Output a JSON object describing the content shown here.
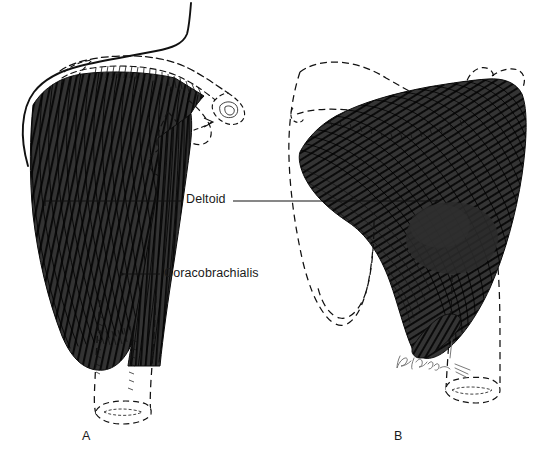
{
  "figure": {
    "background_color": "#ffffff",
    "ink_color": "#111111",
    "muscle_fill_color": "#2f2f2f",
    "muscle_fiber_color": "#0d0d0d",
    "bone_outline_style": "dashed",
    "signature": "R.Vallon"
  },
  "labels": {
    "deltoid": "Deltoid",
    "coracobrachialis": "Coracobrachialis"
  },
  "panels": [
    {
      "letter": "A",
      "view": "anterior",
      "structures": [
        "clavicle",
        "acromion",
        "coracoid process",
        "humerus",
        "deltoid",
        "coracobrachialis"
      ]
    },
    {
      "letter": "B",
      "view": "posterior",
      "structures": [
        "scapula",
        "spine of scapula",
        "acromion",
        "humerus",
        "deltoid"
      ]
    }
  ],
  "leader_lines": {
    "deltoid_left": {
      "x1": 45,
      "y1": 201,
      "x2": 182,
      "y2": 201
    },
    "deltoid_right": {
      "x1": 233,
      "y1": 201,
      "x2": 437,
      "y2": 201
    },
    "coracobrachialis": {
      "x1": 122,
      "y1": 274,
      "x2": 160,
      "y2": 274
    }
  }
}
